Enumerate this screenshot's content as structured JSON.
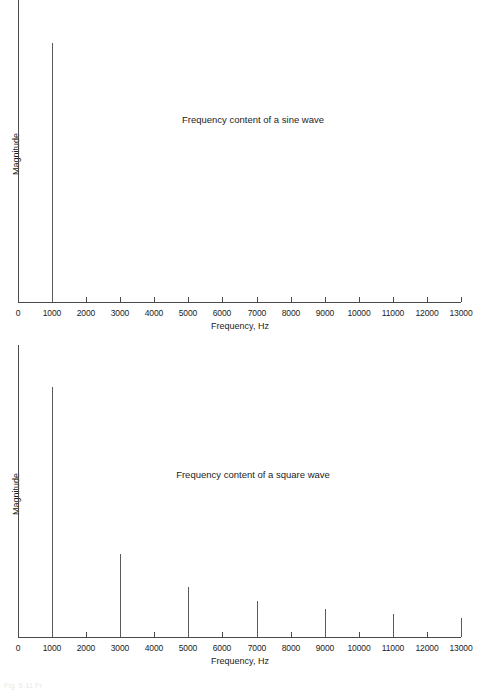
{
  "figure": {
    "background_color": "#ffffff",
    "line_color": "#4a4a4a",
    "spike_color": "#5a5a5a",
    "text_color": "#1c1c1c",
    "caption_partial": "Fig. 5-11  Fr"
  },
  "charts": [
    {
      "id": "sine",
      "title": "Frequency content of a sine wave",
      "xlabel": "Frequency, Hz",
      "ylabel": "Magnitude",
      "xticklabels": [
        "0",
        "1000",
        "2000",
        "3000",
        "4000",
        "5000",
        "6000",
        "7000",
        "8000",
        "9000",
        "10000",
        "11000",
        "12000",
        "13000"
      ]
    },
    {
      "id": "square",
      "title": "Frequency content of a square wave",
      "xlabel": "Frequency, Hz",
      "ylabel": "Magnitude",
      "xticklabels": [
        "0",
        "1000",
        "2000",
        "3000",
        "4000",
        "5000",
        "6000",
        "7000",
        "8000",
        "9000",
        "10000",
        "11000",
        "12000",
        "13000"
      ]
    }
  ],
  "chart_data": [
    {
      "type": "bar",
      "id": "sine",
      "title": "Frequency content of a sine wave",
      "xlabel": "Frequency, Hz",
      "ylabel": "Magnitude",
      "x": [
        1000
      ],
      "values": [
        1.0
      ],
      "categories": [
        "1000"
      ],
      "xlim": [
        0,
        13000
      ],
      "ylim": [
        0,
        1.08
      ],
      "xticks": [
        0,
        1000,
        2000,
        3000,
        4000,
        5000,
        6000,
        7000,
        8000,
        9000,
        10000,
        11000,
        12000,
        13000
      ],
      "yticks": [],
      "grid": false,
      "legend": "none",
      "annotations": [
        "Frequency content of a sine wave"
      ]
    },
    {
      "type": "bar",
      "id": "square",
      "title": "Frequency content of a square wave",
      "xlabel": "Frequency, Hz",
      "ylabel": "Magnitude",
      "x": [
        1000,
        3000,
        5000,
        7000,
        9000,
        11000,
        13000
      ],
      "values": [
        1.0,
        0.333,
        0.2,
        0.143,
        0.111,
        0.091,
        0.077
      ],
      "categories": [
        "1000",
        "3000",
        "5000",
        "7000",
        "9000",
        "11000",
        "13000"
      ],
      "xlim": [
        0,
        13000
      ],
      "ylim": [
        0,
        1.08
      ],
      "xticks": [
        0,
        1000,
        2000,
        3000,
        4000,
        5000,
        6000,
        7000,
        8000,
        9000,
        10000,
        11000,
        12000,
        13000
      ],
      "yticks": [],
      "grid": false,
      "legend": "none",
      "annotations": [
        "Frequency content of a square wave"
      ]
    }
  ]
}
